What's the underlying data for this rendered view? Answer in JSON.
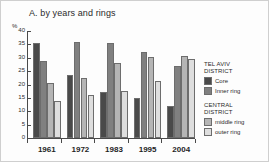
{
  "chart_data": {
    "type": "bar",
    "title": "A. by years and rings",
    "xlabel": "",
    "ylabel": "%",
    "ylim": [
      0,
      40
    ],
    "y_ticks": [
      40,
      35,
      30,
      25,
      20,
      15,
      10,
      5,
      0
    ],
    "grid": false,
    "legend_position": "right",
    "categories": [
      "1961",
      "1972",
      "1983",
      "1995",
      "2004"
    ],
    "series": [
      {
        "name": "Core",
        "group": "TEL AVIV DISTRICT",
        "color": "#4a4a4a",
        "values": [
          35.5,
          23.7,
          17.3,
          14.8,
          12.0
        ]
      },
      {
        "name": "Inner ring",
        "group": "TEL AVIV DISTRICT",
        "color": "#808080",
        "values": [
          28.7,
          36.0,
          35.7,
          32.3,
          27.0
        ]
      },
      {
        "name": "middle ring",
        "group": "CENTRAL DISTRICT",
        "color": "#b5b5b5",
        "values": [
          20.5,
          22.4,
          28.2,
          30.3,
          30.8
        ]
      },
      {
        "name": "outer ring",
        "group": "CENTRAL DISTRICT",
        "color": "#dedede",
        "values": [
          13.8,
          16.1,
          17.4,
          21.2,
          29.4
        ]
      }
    ]
  },
  "legend": {
    "blocks": [
      {
        "heading_line1": "TEL AVIV",
        "heading_line2": "DISTRICT",
        "entries": [
          {
            "label": "Core",
            "color": "#4a4a4a"
          },
          {
            "label": "Inner ring",
            "color": "#808080"
          }
        ]
      },
      {
        "heading_line1": "CENTRAL",
        "heading_line2": "DISTRICT",
        "entries": [
          {
            "label": "middle ring",
            "color": "#b5b5b5"
          },
          {
            "label": "outer ring",
            "color": "#dedede"
          }
        ]
      }
    ]
  }
}
